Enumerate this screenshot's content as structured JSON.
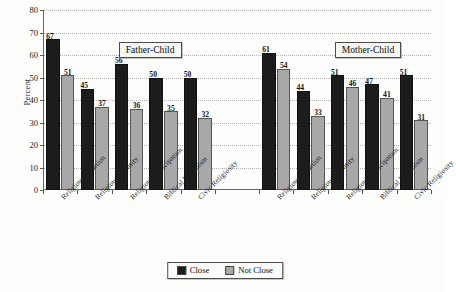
{
  "chart_data": {
    "type": "bar",
    "title": "",
    "xlabel": "",
    "ylabel": "Percent",
    "ylim": [
      0,
      80
    ],
    "ytick_step": 10,
    "yticks": [
      0,
      10,
      20,
      30,
      40,
      50,
      60,
      70,
      80
    ],
    "grid": true,
    "legend_position": "bottom-center",
    "categories": [
      "Religious Tradition",
      "Religious Intensity",
      "Religious Participation",
      "Biblical Literalism",
      "Civic Religiosity"
    ],
    "panels": [
      {
        "label": "Father-Child",
        "series": [
          {
            "name": "Close",
            "values": [
              67,
              45,
              56,
              50,
              50
            ]
          },
          {
            "name": "Not Close",
            "values": [
              51,
              37,
              36,
              35,
              32
            ]
          }
        ]
      },
      {
        "label": "Mother-Child",
        "series": [
          {
            "name": "Close",
            "values": [
              61,
              44,
              51,
              47,
              51
            ]
          },
          {
            "name": "Not Close",
            "values": [
              54,
              33,
              46,
              41,
              31
            ]
          }
        ]
      }
    ],
    "legend": [
      {
        "label": "Close",
        "color": "#1c1c1c"
      },
      {
        "label": "Not Close",
        "color": "#a8a8a8"
      }
    ],
    "colors": {
      "close": "#1c1c1c",
      "not_close": "#a8a8a8",
      "axis": "#666666",
      "grid": "#b4b4b4",
      "background": "#fdfdfc"
    }
  }
}
